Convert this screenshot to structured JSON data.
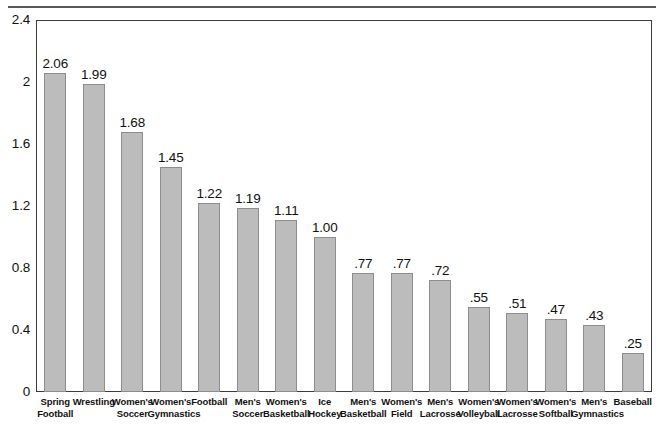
{
  "figure": {
    "top_rule": "horizontal-rule"
  },
  "chart_data": {
    "type": "bar",
    "title": "",
    "subtitle": "",
    "xlabel": "",
    "ylabel": "",
    "ylim": [
      0,
      2.4
    ],
    "grid": false,
    "legend": false,
    "orientation": "vertical",
    "bar_color": "#bcbcbc",
    "bar_border_color": "#8d8d8d",
    "y_ticks": [
      "0",
      "0.4",
      "0.8",
      "1.2",
      "1.6",
      "2",
      "2.4"
    ],
    "y_tick_values": [
      0,
      0.4,
      0.8,
      1.2,
      1.6,
      2,
      2.4
    ],
    "categories": [
      "Spring Football",
      "Wrestling",
      "Women's Soccer",
      "Women's Gymnastics",
      "Football",
      "Men's Soccer",
      "Women's Basketball",
      "Ice Hockey",
      "Men's Basketball",
      "Women's Field",
      "Men's Lacrosse",
      "Women's Volleyball",
      "Women's Lacrosse",
      "Women's Softball",
      "Men's Gymnastics",
      "Baseball"
    ],
    "category_lines": [
      [
        "Spring",
        "Football"
      ],
      [
        "Wrestling",
        ""
      ],
      [
        "Women's",
        "Soccer"
      ],
      [
        "Women's",
        "Gymnastics"
      ],
      [
        "Football",
        ""
      ],
      [
        "Men's",
        "Soccer"
      ],
      [
        "Women's",
        "Basketball"
      ],
      [
        "Ice",
        "Hockey"
      ],
      [
        "Men's",
        "Basketball"
      ],
      [
        "Women's",
        "Field"
      ],
      [
        "Men's",
        "Lacrosse"
      ],
      [
        "Women's",
        "Volleyball"
      ],
      [
        "Women's",
        "Lacrosse"
      ],
      [
        "Women's",
        "Softball"
      ],
      [
        "Men's",
        "Gymnastics"
      ],
      [
        "Baseball",
        ""
      ]
    ],
    "values": [
      2.06,
      1.99,
      1.68,
      1.45,
      1.22,
      1.19,
      1.11,
      1.0,
      0.77,
      0.77,
      0.72,
      0.55,
      0.51,
      0.47,
      0.43,
      0.25
    ],
    "value_labels": [
      "2.06",
      "1.99",
      "1.68",
      "1.45",
      "1.22",
      "1.19",
      "1.11",
      "1.00",
      ".77",
      ".77",
      ".72",
      ".55",
      ".51",
      ".47",
      ".43",
      ".25"
    ]
  }
}
